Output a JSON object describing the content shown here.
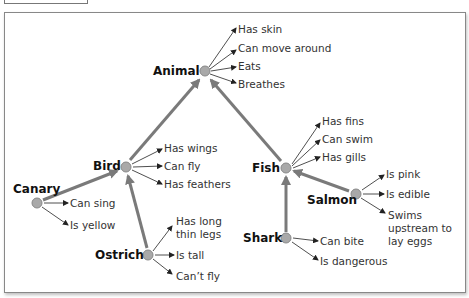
{
  "diagram": {
    "title_fragment": "...p...g...",
    "nodes": [
      {
        "id": "animal",
        "label": "Animal",
        "x": 205,
        "y": 71,
        "properties": [
          "Has skin",
          "Can move around",
          "Eats",
          "Breathes"
        ]
      },
      {
        "id": "bird",
        "label": "Bird",
        "x": 126,
        "y": 167,
        "properties": [
          "Has wings",
          "Can fly",
          "Has feathers"
        ]
      },
      {
        "id": "fish",
        "label": "Fish",
        "x": 286,
        "y": 168,
        "properties": [
          "Has fins",
          "Can swim",
          "Has gills"
        ]
      },
      {
        "id": "canary",
        "label": "Canary",
        "x": 37,
        "y": 203,
        "properties": [
          "Can sing",
          "Is yellow"
        ]
      },
      {
        "id": "ostrich",
        "label": "Ostrich",
        "x": 148,
        "y": 255,
        "properties": [
          "Has long thin legs",
          "Is tall",
          "Can't fly"
        ]
      },
      {
        "id": "salmon",
        "label": "Salmon",
        "x": 356,
        "y": 194,
        "properties": [
          "Is pink",
          "Is edible",
          "Swims upstream to lay eggs"
        ]
      },
      {
        "id": "shark",
        "label": "Shark",
        "x": 286,
        "y": 238,
        "properties": [
          "Can bite",
          "Is dangerous"
        ]
      }
    ],
    "edges": [
      {
        "from": "bird",
        "to": "animal"
      },
      {
        "from": "fish",
        "to": "animal"
      },
      {
        "from": "canary",
        "to": "bird"
      },
      {
        "from": "ostrich",
        "to": "bird"
      },
      {
        "from": "salmon",
        "to": "fish"
      },
      {
        "from": "shark",
        "to": "fish"
      }
    ],
    "labels": {
      "animal": "Animal",
      "bird": "Bird",
      "fish": "Fish",
      "canary": "Canary",
      "ostrich": "Ostrich",
      "salmon": "Salmon",
      "shark": "Shark",
      "animal_p1": "Has skin",
      "animal_p2": "Can move around",
      "animal_p3": "Eats",
      "animal_p4": "Breathes",
      "bird_p1": "Has wings",
      "bird_p2": "Can fly",
      "bird_p3": "Has feathers",
      "fish_p1": "Has fins",
      "fish_p2": "Can swim",
      "fish_p3": "Has gills",
      "canary_p1": "Can sing",
      "canary_p2": "Is yellow",
      "ostrich_p1a": "Has long",
      "ostrich_p1b": "thin legs",
      "ostrich_p2": "Is tall",
      "ostrich_p3": "Can’t fly",
      "salmon_p1": "Is pink",
      "salmon_p2": "Is edible",
      "salmon_p3a": "Swims",
      "salmon_p3b": "upstream to",
      "salmon_p3c": "lay eggs",
      "shark_p1": "Can bite",
      "shark_p2": "Is dangerous"
    },
    "colors": {
      "node_fill": "#a9a9a9",
      "hierarchy_edge": "#7a7a7a",
      "property_arrow": "#222222",
      "frame": "#888888"
    }
  }
}
